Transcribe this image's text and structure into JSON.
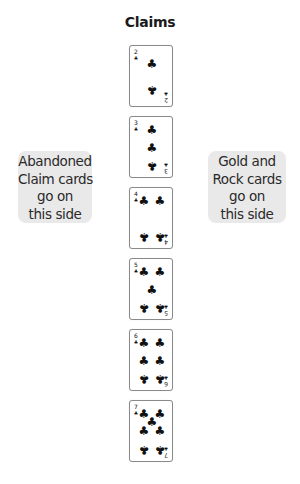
{
  "title": "Claims",
  "left_note": {
    "lines": [
      "Abandoned",
      "Claim cards",
      "go on",
      "this side"
    ]
  },
  "right_note": {
    "lines": [
      "Gold and",
      "Rock cards",
      "go on",
      "this side"
    ]
  },
  "suit_symbol": "♣",
  "cards": [
    {
      "rank": "2",
      "suit": "clubs",
      "top": 45
    },
    {
      "rank": "3",
      "suit": "clubs",
      "top": 116
    },
    {
      "rank": "4",
      "suit": "clubs",
      "top": 187
    },
    {
      "rank": "5",
      "suit": "clubs",
      "top": 258
    },
    {
      "rank": "6",
      "suit": "clubs",
      "top": 329
    },
    {
      "rank": "7",
      "suit": "clubs",
      "top": 400
    }
  ],
  "colors": {
    "note_bg": "#e9e9e9",
    "card_border": "#8a8a8a",
    "ink": "#111111"
  }
}
